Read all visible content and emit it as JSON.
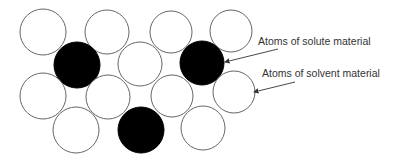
{
  "diagram": {
    "colors": {
      "solvent_fill": "#ffffff",
      "solvent_stroke": "#666666",
      "solute_fill": "#000000",
      "arrow": "#333333"
    },
    "atoms": [
      {
        "type": "solvent",
        "cx": 43,
        "cy": 32,
        "r": 23
      },
      {
        "type": "solvent",
        "cx": 107,
        "cy": 32,
        "r": 22
      },
      {
        "type": "solvent",
        "cx": 171,
        "cy": 32,
        "r": 21
      },
      {
        "type": "solvent",
        "cx": 231,
        "cy": 31,
        "r": 21
      },
      {
        "type": "solute",
        "cx": 77,
        "cy": 65,
        "r": 23
      },
      {
        "type": "solvent",
        "cx": 140,
        "cy": 64,
        "r": 22
      },
      {
        "type": "solute",
        "cx": 202,
        "cy": 63,
        "r": 22
      },
      {
        "type": "solvent",
        "cx": 43,
        "cy": 96,
        "r": 23
      },
      {
        "type": "solvent",
        "cx": 108,
        "cy": 97,
        "r": 22
      },
      {
        "type": "solvent",
        "cx": 172,
        "cy": 96,
        "r": 21
      },
      {
        "type": "solvent",
        "cx": 234,
        "cy": 92,
        "r": 21
      },
      {
        "type": "solvent",
        "cx": 76,
        "cy": 130,
        "r": 23
      },
      {
        "type": "solute",
        "cx": 141,
        "cy": 130,
        "r": 23
      },
      {
        "type": "solvent",
        "cx": 203,
        "cy": 128,
        "r": 22
      }
    ],
    "labels": [
      {
        "text": "Atoms of solute material",
        "x": 258,
        "y": 35,
        "arrow": {
          "x1": 278,
          "y1": 49,
          "x2": 225,
          "y2": 62
        }
      },
      {
        "text": "Atoms of solvent material",
        "x": 262,
        "y": 67,
        "arrow": {
          "x1": 295,
          "y1": 82,
          "x2": 254,
          "y2": 92
        }
      }
    ]
  }
}
